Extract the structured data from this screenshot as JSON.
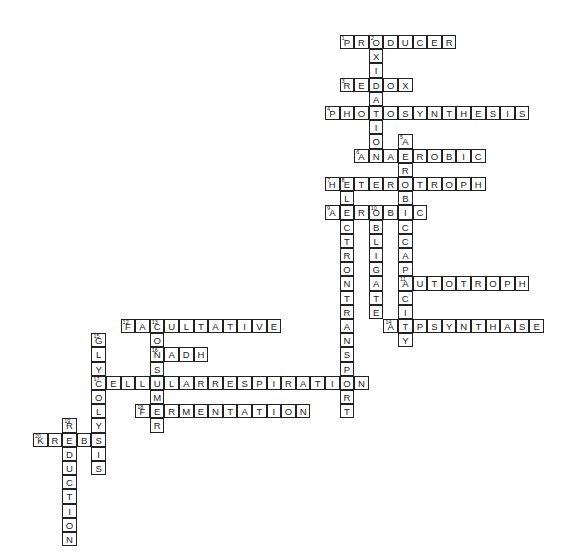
{
  "puzzle": {
    "type": "crossword",
    "grid": {
      "origin_x": 33,
      "origin_y": 35,
      "cell_w": 14.6,
      "cell_h": 14.2
    },
    "words": [
      {
        "num": 1,
        "word": "PRODUCER",
        "dir": "across",
        "row": 0,
        "col": 21
      },
      {
        "num": 2,
        "word": "OXIDATION",
        "dir": "down",
        "row": 0,
        "col": 23
      },
      {
        "num": 3,
        "word": "REDOX",
        "dir": "across",
        "row": 3,
        "col": 21
      },
      {
        "num": 4,
        "word": "PHOTOSYNTHESIS",
        "dir": "across",
        "row": 5,
        "col": 20
      },
      {
        "num": 5,
        "word": "AEROBICCAPACITY",
        "dir": "down",
        "row": 7,
        "col": 25
      },
      {
        "num": 6,
        "word": "ANAEROBIC",
        "dir": "across",
        "row": 8,
        "col": 22
      },
      {
        "num": 7,
        "word": "HETEROTROPH",
        "dir": "across",
        "row": 10,
        "col": 20
      },
      {
        "num": 8,
        "word": "ELECTRONTRANSPORT",
        "dir": "down",
        "row": 10,
        "col": 21
      },
      {
        "num": 9,
        "word": "AEROBIC",
        "dir": "across",
        "row": 12,
        "col": 20
      },
      {
        "num": 10,
        "word": "OBLIGATE",
        "dir": "down",
        "row": 12,
        "col": 23
      },
      {
        "num": 11,
        "word": "AUTOTROPH",
        "dir": "across",
        "row": 17,
        "col": 25
      },
      {
        "num": 12,
        "word": "FACULTATIVE",
        "dir": "across",
        "row": 20,
        "col": 6
      },
      {
        "num": 13,
        "word": "CONSUMER",
        "dir": "down",
        "row": 20,
        "col": 8
      },
      {
        "num": 14,
        "word": "ATPSYNTHASE",
        "dir": "across",
        "row": 20,
        "col": 24
      },
      {
        "num": 15,
        "word": "GLYCOLYSIS",
        "dir": "down",
        "row": 21,
        "col": 4
      },
      {
        "num": 16,
        "word": "NADH",
        "dir": "across",
        "row": 22,
        "col": 8
      },
      {
        "num": 17,
        "word": "CELLULARRESPIRATION",
        "dir": "across",
        "row": 24,
        "col": 4
      },
      {
        "num": 18,
        "word": "FERMENTATION",
        "dir": "across",
        "row": 26,
        "col": 7
      },
      {
        "num": 19,
        "word": "REDUCTION",
        "dir": "down",
        "row": 27,
        "col": 2
      },
      {
        "num": 20,
        "word": "KREBS",
        "dir": "across",
        "row": 28,
        "col": 0
      }
    ]
  }
}
